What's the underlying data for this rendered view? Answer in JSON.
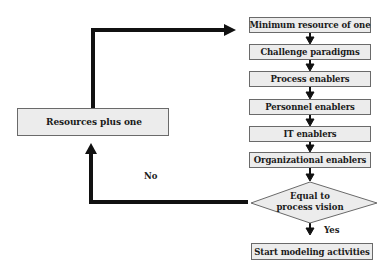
{
  "diagram": {
    "type": "flowchart",
    "left_box": {
      "label": "Resources plus one"
    },
    "steps": [
      {
        "label": "Minimum resource of one"
      },
      {
        "label": "Challenge paradigms"
      },
      {
        "label": "Process enablers"
      },
      {
        "label": "Personnel enablers"
      },
      {
        "label": "IT enablers"
      },
      {
        "label": "Organizational enablers"
      }
    ],
    "decision": {
      "line1": "Equal to",
      "line2": "process vision"
    },
    "edges": {
      "no_label": "No",
      "yes_label": "Yes"
    },
    "end_box": {
      "label": "Start modeling activities"
    },
    "colors": {
      "box_fill": "#ececec",
      "box_border": "#6a6a6a",
      "arrow": "#111111"
    }
  }
}
